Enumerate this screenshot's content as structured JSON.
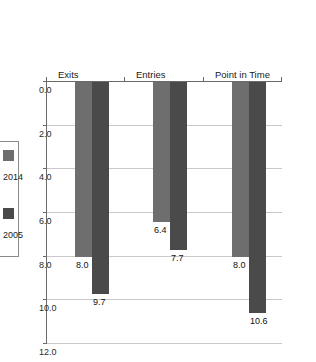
{
  "chart_data": {
    "type": "bar",
    "title": "",
    "subtitle": "",
    "xlabel": "",
    "ylabel": "",
    "orientation": "vertical-bars-rotated-90cw",
    "categories": [
      "Point in Time",
      "Entries",
      "Exits"
    ],
    "series": [
      {
        "name": "2005",
        "color": "#4a4a4a",
        "values": [
          10.6,
          7.7,
          9.7
        ],
        "labels": [
          "10.6",
          "7.7",
          "9.7"
        ]
      },
      {
        "name": "2014",
        "color": "#6e6e6e",
        "values": [
          8.0,
          6.4,
          8.0
        ],
        "labels": [
          "8.0",
          "6.4",
          "8.0"
        ]
      }
    ],
    "ylim": [
      0.0,
      12.0
    ],
    "ytick_values": [
      0.0,
      2.0,
      4.0,
      6.0,
      8.0,
      10.0,
      12.0
    ],
    "ytick_labels": [
      "0.0",
      "2.0",
      "4.0",
      "6.0",
      "8.0",
      "10.0",
      "12.0"
    ],
    "grid": true,
    "grid_axis": "value",
    "legend_position": "right",
    "legend_entries": [
      "2005",
      "2014"
    ],
    "legend_order_displayed": [
      "2014",
      "2005"
    ]
  },
  "colors": {
    "series_2005": "#4a4a4a",
    "series_2014": "#6e6e6e",
    "gridline": "#c9c9c9",
    "axis": "#6a6a6a",
    "background": "#ffffff",
    "text": "#1a1a1a"
  }
}
